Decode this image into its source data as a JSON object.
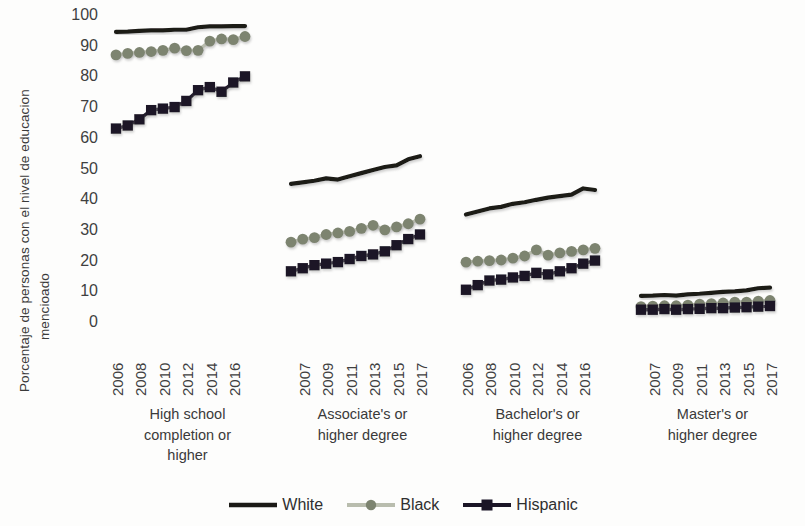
{
  "chart_data": {
    "type": "line",
    "title": "",
    "xlabel": "",
    "ylabel_line1": "Porcentaje de personas con el nivel de educacion",
    "ylabel_line2": "mencioado",
    "ylim": [
      0,
      100
    ],
    "ytick_labels": [
      "100",
      "90",
      "80",
      "70",
      "60",
      "50",
      "40",
      "30",
      "20",
      "10",
      "0"
    ],
    "ytick_values": [
      100,
      90,
      80,
      70,
      60,
      50,
      40,
      30,
      20,
      10,
      0
    ],
    "grid": false,
    "legend_position": "bottom-center",
    "legend": [
      "White",
      "Black",
      "Hispanic"
    ],
    "series_colors": {
      "White": "#1b1a16",
      "Black": "#7d8470",
      "Hispanic": "#1b1526"
    },
    "series_markers": {
      "White": "none",
      "Black": "circle",
      "Hispanic": "square"
    },
    "x": [
      2006,
      2007,
      2008,
      2009,
      2010,
      2011,
      2012,
      2013,
      2014,
      2015,
      2016,
      2017
    ],
    "groups": [
      {
        "label_lines": [
          "High school",
          "completion or",
          "higher"
        ],
        "tick_labels": [
          "2006",
          "2008",
          "2010",
          "2012",
          "2014",
          "2016"
        ],
        "tick_indices": [
          0,
          2,
          4,
          6,
          8,
          10
        ],
        "series": [
          {
            "name": "White",
            "values": [
              94.5,
              94.6,
              94.8,
              95.0,
              95.0,
              95.2,
              95.2,
              96.0,
              96.3,
              96.3,
              96.4,
              96.4
            ]
          },
          {
            "name": "Black",
            "values": [
              87.0,
              87.5,
              87.8,
              88.1,
              88.5,
              89.2,
              88.4,
              88.5,
              91.5,
              92.2,
              92.0,
              93.0
            ]
          },
          {
            "name": "Hispanic",
            "values": [
              63.0,
              64.0,
              66.0,
              69.0,
              69.5,
              70.0,
              72.0,
              75.5,
              76.5,
              75.0,
              78.0,
              80.0,
              83.0
            ]
          }
        ]
      },
      {
        "label_lines": [
          "Associate's or",
          "higher degree"
        ],
        "tick_labels": [
          "2007",
          "2009",
          "2011",
          "2013",
          "2015",
          "2017"
        ],
        "tick_indices": [
          1,
          3,
          5,
          7,
          9,
          11
        ],
        "series": [
          {
            "name": "White",
            "values": [
              45.0,
              45.5,
              46.0,
              46.8,
              46.4,
              47.5,
              48.5,
              49.5,
              50.5,
              51.0,
              53.0,
              54.0
            ]
          },
          {
            "name": "Black",
            "values": [
              26.0,
              27.0,
              27.5,
              28.5,
              29.0,
              29.5,
              30.5,
              31.5,
              30.0,
              31.0,
              32.0,
              33.5
            ]
          },
          {
            "name": "Hispanic",
            "values": [
              16.5,
              17.5,
              18.5,
              19.0,
              19.5,
              20.5,
              21.5,
              22.0,
              23.0,
              25.0,
              27.0,
              28.5
            ]
          }
        ]
      },
      {
        "label_lines": [
          "Bachelor's or",
          "higher degree"
        ],
        "tick_labels": [
          "2006",
          "2008",
          "2010",
          "2012",
          "2014",
          "2016"
        ],
        "tick_indices": [
          0,
          2,
          4,
          6,
          8,
          10
        ],
        "series": [
          {
            "name": "White",
            "values": [
              35.0,
              36.0,
              37.0,
              37.5,
              38.5,
              39.0,
              39.8,
              40.5,
              41.0,
              41.5,
              43.5,
              43.0
            ]
          },
          {
            "name": "Black",
            "values": [
              19.5,
              19.8,
              20.0,
              20.2,
              20.8,
              21.5,
              23.5,
              21.8,
              22.5,
              23.0,
              23.5,
              24.0
            ]
          },
          {
            "name": "Hispanic",
            "values": [
              10.5,
              12.0,
              13.5,
              13.8,
              14.5,
              15.0,
              16.0,
              15.5,
              16.5,
              17.5,
              19.0,
              20.0
            ]
          }
        ]
      },
      {
        "label_lines": [
          "Master's or",
          "higher degree"
        ],
        "tick_labels": [
          "2007",
          "2009",
          "2011",
          "2013",
          "2015",
          "2017"
        ],
        "tick_indices": [
          1,
          3,
          5,
          7,
          9,
          11
        ],
        "series": [
          {
            "name": "White",
            "values": [
              8.5,
              8.6,
              8.8,
              8.6,
              9.0,
              9.2,
              9.5,
              9.8,
              10.0,
              10.3,
              11.0,
              11.2
            ]
          },
          {
            "name": "Black",
            "values": [
              5.0,
              5.2,
              5.3,
              5.3,
              5.5,
              5.8,
              6.0,
              6.2,
              6.5,
              6.5,
              6.8,
              7.0
            ]
          },
          {
            "name": "Hispanic",
            "values": [
              4.0,
              4.0,
              4.2,
              4.0,
              4.2,
              4.3,
              4.5,
              4.5,
              4.7,
              4.8,
              5.0,
              5.2
            ]
          }
        ]
      }
    ]
  }
}
